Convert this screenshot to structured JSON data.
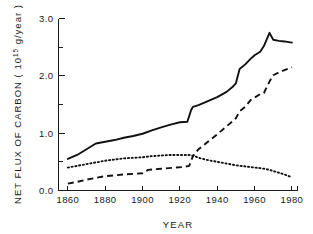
{
  "chart_data": {
    "type": "line",
    "title": "",
    "xlabel": "YEAR",
    "ylabel": "NET FLUX OF CARBON ( 10¹⁵ g/year )",
    "ylabel_parts": {
      "prefix": "NET FLUX OF CARBON ( 10",
      "exponent": "15",
      "suffix": " g/year )"
    },
    "xlim": [
      1855,
      1983
    ],
    "ylim": [
      0.0,
      3.0
    ],
    "grid": false,
    "legend_position": "none",
    "xticks": [
      1860,
      1880,
      1900,
      1920,
      1940,
      1960,
      1980
    ],
    "xtick_labels": [
      "1860",
      "1880",
      "1900",
      "1920",
      "1940",
      "1960",
      "1980"
    ],
    "yticks": [
      0.0,
      0.5,
      1.0,
      1.5,
      2.0,
      2.5,
      3.0
    ],
    "ytick_labels": [
      "0.0",
      "",
      "1.0",
      "",
      "2.0",
      "",
      "3.0"
    ],
    "ytick_labels_shown": [
      "0.0",
      "1.0",
      "2.0",
      "3.0"
    ],
    "series": [
      {
        "name": "Total net flux (solid)",
        "style": "solid",
        "x": [
          1860,
          1865,
          1870,
          1875,
          1880,
          1885,
          1890,
          1895,
          1900,
          1905,
          1910,
          1915,
          1920,
          1924,
          1926,
          1927,
          1930,
          1935,
          1940,
          1945,
          1948,
          1950,
          1952,
          1955,
          1958,
          1960,
          1963,
          1965,
          1968,
          1970,
          1973,
          1976,
          1980
        ],
        "values": [
          0.55,
          0.62,
          0.72,
          0.82,
          0.85,
          0.88,
          0.92,
          0.95,
          0.99,
          1.05,
          1.1,
          1.15,
          1.19,
          1.2,
          1.4,
          1.46,
          1.49,
          1.56,
          1.63,
          1.72,
          1.8,
          1.87,
          2.12,
          2.2,
          2.3,
          2.36,
          2.42,
          2.52,
          2.75,
          2.63,
          2.61,
          2.6,
          2.58
        ]
      },
      {
        "name": "Fossil fuel flux (dashed)",
        "style": "dashed",
        "x": [
          1860,
          1865,
          1870,
          1880,
          1890,
          1900,
          1903,
          1910,
          1918,
          1922,
          1925,
          1927,
          1930,
          1935,
          1940,
          1945,
          1948,
          1950,
          1952,
          1955,
          1958,
          1960,
          1963,
          1965,
          1968,
          1970,
          1973,
          1976,
          1980
        ],
        "values": [
          0.12,
          0.15,
          0.19,
          0.25,
          0.28,
          0.3,
          0.36,
          0.38,
          0.4,
          0.41,
          0.43,
          0.6,
          0.72,
          0.85,
          0.98,
          1.12,
          1.2,
          1.26,
          1.38,
          1.46,
          1.58,
          1.62,
          1.68,
          1.7,
          1.9,
          2.01,
          2.06,
          2.1,
          2.15
        ]
      },
      {
        "name": "Biotic / land-use flux (dotted)",
        "style": "dotted",
        "x": [
          1860,
          1865,
          1870,
          1875,
          1880,
          1885,
          1890,
          1895,
          1900,
          1905,
          1910,
          1915,
          1920,
          1925,
          1928,
          1930,
          1935,
          1940,
          1945,
          1950,
          1955,
          1960,
          1963,
          1965,
          1968,
          1970,
          1973,
          1976,
          1980
        ],
        "values": [
          0.4,
          0.43,
          0.46,
          0.49,
          0.52,
          0.54,
          0.56,
          0.57,
          0.58,
          0.6,
          0.61,
          0.62,
          0.62,
          0.62,
          0.6,
          0.57,
          0.53,
          0.5,
          0.47,
          0.44,
          0.42,
          0.4,
          0.39,
          0.38,
          0.36,
          0.34,
          0.31,
          0.28,
          0.23
        ]
      }
    ]
  }
}
